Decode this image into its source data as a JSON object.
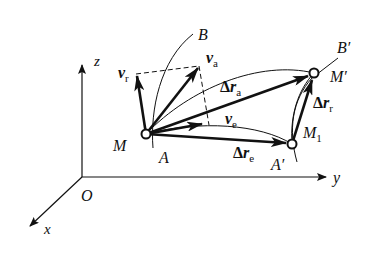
{
  "figure": {
    "colors": {
      "ink": "#111111",
      "background": "#ffffff"
    }
  },
  "axes": {
    "origin": "O",
    "x": "x",
    "y": "y",
    "z": "z"
  },
  "points": {
    "M": "M",
    "M_prime": "M′",
    "M1": "M",
    "M1_sub": "1",
    "A": "A",
    "A_prime": "A′",
    "B": "B",
    "B_prime": "B′"
  },
  "vectors": {
    "v_r": {
      "symbol": "v",
      "sub": "r"
    },
    "v_a": {
      "symbol": "v",
      "sub": "a"
    },
    "v_e": {
      "symbol": "v",
      "sub": "e"
    },
    "dr_a": {
      "delta": "Δ",
      "symbol": "r",
      "sub": "a"
    },
    "dr_e": {
      "delta": "Δ",
      "symbol": "r",
      "sub": "e"
    },
    "dr_r": {
      "delta": "Δ",
      "symbol": "r",
      "sub": "r"
    }
  }
}
